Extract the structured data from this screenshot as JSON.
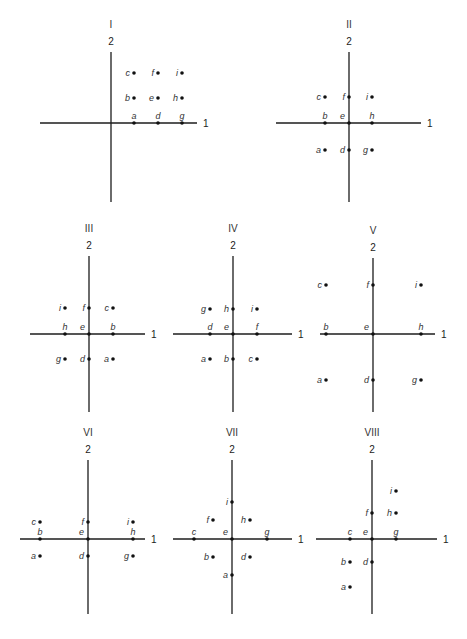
{
  "figure": {
    "axis_labels": {
      "horizontal": "1",
      "vertical": "2"
    },
    "panels": [
      {
        "id": "I",
        "title": "I",
        "origin": [
          111,
          123
        ],
        "vaxis": [
          52,
          202
        ],
        "haxis": [
          40,
          197
        ],
        "points": [
          {
            "label": "a",
            "x": 134,
            "y": 123,
            "label_pos": "above"
          },
          {
            "label": "d",
            "x": 158,
            "y": 123,
            "label_pos": "above"
          },
          {
            "label": "g",
            "x": 182,
            "y": 123,
            "label_pos": "above"
          },
          {
            "label": "b",
            "x": 134,
            "y": 98,
            "label_pos": "left"
          },
          {
            "label": "e",
            "x": 158,
            "y": 98,
            "label_pos": "left"
          },
          {
            "label": "h",
            "x": 182,
            "y": 98,
            "label_pos": "left"
          },
          {
            "label": "c",
            "x": 134,
            "y": 73,
            "label_pos": "left"
          },
          {
            "label": "f",
            "x": 158,
            "y": 73,
            "label_pos": "left"
          },
          {
            "label": "i",
            "x": 182,
            "y": 73,
            "label_pos": "left"
          }
        ]
      },
      {
        "id": "II",
        "title": "II",
        "origin": [
          349,
          123
        ],
        "vaxis": [
          52,
          202
        ],
        "haxis": [
          276,
          421
        ],
        "points": [
          {
            "label": "c",
            "x": 325,
            "y": 97,
            "label_pos": "left"
          },
          {
            "label": "f",
            "x": 349,
            "y": 97,
            "label_pos": "left"
          },
          {
            "label": "i",
            "x": 372,
            "y": 97,
            "label_pos": "left"
          },
          {
            "label": "b",
            "x": 325,
            "y": 123,
            "label_pos": "above"
          },
          {
            "label": "e",
            "x": 349,
            "y": 123,
            "label_pos": "above-left"
          },
          {
            "label": "h",
            "x": 372,
            "y": 123,
            "label_pos": "above"
          },
          {
            "label": "a",
            "x": 325,
            "y": 150,
            "label_pos": "left"
          },
          {
            "label": "d",
            "x": 349,
            "y": 150,
            "label_pos": "left"
          },
          {
            "label": "g",
            "x": 372,
            "y": 150,
            "label_pos": "left"
          }
        ]
      },
      {
        "id": "III",
        "title": "III",
        "origin": [
          89,
          334
        ],
        "vaxis": [
          256,
          412
        ],
        "haxis": [
          30,
          145
        ],
        "points": [
          {
            "label": "i",
            "x": 65,
            "y": 308,
            "label_pos": "left"
          },
          {
            "label": "f",
            "x": 89,
            "y": 308,
            "label_pos": "left"
          },
          {
            "label": "c",
            "x": 113,
            "y": 308,
            "label_pos": "left"
          },
          {
            "label": "h",
            "x": 65,
            "y": 334,
            "label_pos": "above"
          },
          {
            "label": "e",
            "x": 89,
            "y": 334,
            "label_pos": "above-left"
          },
          {
            "label": "b",
            "x": 113,
            "y": 334,
            "label_pos": "above"
          },
          {
            "label": "g",
            "x": 65,
            "y": 359,
            "label_pos": "left"
          },
          {
            "label": "d",
            "x": 89,
            "y": 359,
            "label_pos": "left"
          },
          {
            "label": "a",
            "x": 113,
            "y": 359,
            "label_pos": "left"
          }
        ]
      },
      {
        "id": "IV",
        "title": "IV",
        "origin": [
          233,
          334
        ],
        "vaxis": [
          256,
          412
        ],
        "haxis": [
          173,
          292
        ],
        "points": [
          {
            "label": "g",
            "x": 210,
            "y": 309,
            "label_pos": "left"
          },
          {
            "label": "h",
            "x": 233,
            "y": 309,
            "label_pos": "left"
          },
          {
            "label": "i",
            "x": 257,
            "y": 309,
            "label_pos": "left"
          },
          {
            "label": "d",
            "x": 210,
            "y": 334,
            "label_pos": "above"
          },
          {
            "label": "e",
            "x": 233,
            "y": 334,
            "label_pos": "above-left"
          },
          {
            "label": "f",
            "x": 257,
            "y": 334,
            "label_pos": "above"
          },
          {
            "label": "a",
            "x": 210,
            "y": 359,
            "label_pos": "left"
          },
          {
            "label": "b",
            "x": 233,
            "y": 359,
            "label_pos": "left"
          },
          {
            "label": "c",
            "x": 257,
            "y": 359,
            "label_pos": "left"
          }
        ]
      },
      {
        "id": "V",
        "title": "V",
        "origin": [
          373,
          334
        ],
        "vaxis": [
          258,
          412
        ],
        "haxis": [
          320,
          435
        ],
        "points": [
          {
            "label": "c",
            "x": 326,
            "y": 285,
            "label_pos": "left"
          },
          {
            "label": "f",
            "x": 373,
            "y": 285,
            "label_pos": "left"
          },
          {
            "label": "i",
            "x": 421,
            "y": 285,
            "label_pos": "left"
          },
          {
            "label": "b",
            "x": 326,
            "y": 334,
            "label_pos": "above"
          },
          {
            "label": "e",
            "x": 373,
            "y": 334,
            "label_pos": "above-left"
          },
          {
            "label": "h",
            "x": 421,
            "y": 334,
            "label_pos": "above"
          },
          {
            "label": "a",
            "x": 326,
            "y": 380,
            "label_pos": "left"
          },
          {
            "label": "d",
            "x": 373,
            "y": 380,
            "label_pos": "left"
          },
          {
            "label": "g",
            "x": 421,
            "y": 380,
            "label_pos": "left"
          }
        ]
      },
      {
        "id": "VI",
        "title": "VI",
        "origin": [
          88,
          539
        ],
        "vaxis": [
          460,
          614
        ],
        "haxis": [
          20,
          145
        ],
        "points": [
          {
            "label": "c",
            "x": 40,
            "y": 522,
            "label_pos": "left"
          },
          {
            "label": "f",
            "x": 88,
            "y": 522,
            "label_pos": "left"
          },
          {
            "label": "i",
            "x": 133,
            "y": 522,
            "label_pos": "left"
          },
          {
            "label": "b",
            "x": 40,
            "y": 539,
            "label_pos": "above"
          },
          {
            "label": "e",
            "x": 88,
            "y": 539,
            "label_pos": "above-left"
          },
          {
            "label": "h",
            "x": 133,
            "y": 539,
            "label_pos": "above"
          },
          {
            "label": "a",
            "x": 40,
            "y": 556,
            "label_pos": "left"
          },
          {
            "label": "d",
            "x": 88,
            "y": 556,
            "label_pos": "left"
          },
          {
            "label": "g",
            "x": 133,
            "y": 556,
            "label_pos": "left"
          }
        ]
      },
      {
        "id": "VII",
        "title": "VII",
        "origin": [
          232,
          539
        ],
        "vaxis": [
          460,
          614
        ],
        "haxis": [
          173,
          292
        ],
        "points": [
          {
            "label": "i",
            "x": 232,
            "y": 502,
            "label_pos": "left"
          },
          {
            "label": "f",
            "x": 213,
            "y": 520,
            "label_pos": "left"
          },
          {
            "label": "h",
            "x": 250,
            "y": 520,
            "label_pos": "left"
          },
          {
            "label": "c",
            "x": 194,
            "y": 539,
            "label_pos": "above"
          },
          {
            "label": "e",
            "x": 232,
            "y": 539,
            "label_pos": "above-left"
          },
          {
            "label": "g",
            "x": 267,
            "y": 539,
            "label_pos": "above"
          },
          {
            "label": "b",
            "x": 213,
            "y": 557,
            "label_pos": "left"
          },
          {
            "label": "d",
            "x": 250,
            "y": 557,
            "label_pos": "left"
          },
          {
            "label": "a",
            "x": 232,
            "y": 575,
            "label_pos": "left"
          }
        ]
      },
      {
        "id": "VIII",
        "title": "VIII",
        "origin": [
          372,
          539
        ],
        "vaxis": [
          460,
          614
        ],
        "haxis": [
          316,
          437
        ],
        "points": [
          {
            "label": "i",
            "x": 396,
            "y": 491,
            "label_pos": "left"
          },
          {
            "label": "f",
            "x": 372,
            "y": 513,
            "label_pos": "left"
          },
          {
            "label": "h",
            "x": 396,
            "y": 513,
            "label_pos": "left"
          },
          {
            "label": "c",
            "x": 350,
            "y": 539,
            "label_pos": "above"
          },
          {
            "label": "e",
            "x": 372,
            "y": 539,
            "label_pos": "above-left"
          },
          {
            "label": "g",
            "x": 396,
            "y": 539,
            "label_pos": "above"
          },
          {
            "label": "b",
            "x": 350,
            "y": 562,
            "label_pos": "left"
          },
          {
            "label": "d",
            "x": 372,
            "y": 562,
            "label_pos": "left"
          },
          {
            "label": "a",
            "x": 350,
            "y": 587,
            "label_pos": "left"
          }
        ]
      }
    ]
  }
}
